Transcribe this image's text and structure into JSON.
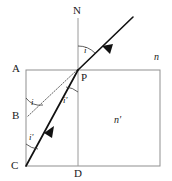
{
  "figure": {
    "background_color": "#ffffff",
    "line_color": "#1a1a1a",
    "box_color": "#808080",
    "normal_color": "#8c8c8c",
    "dotted_color": "#4d4d4d"
  },
  "labels": {
    "normal_top": "N",
    "point_A": "A",
    "point_B": "B",
    "point_C": "C",
    "point_D": "D",
    "point_P": "P",
    "index_outside": "n",
    "index_inside": "n′",
    "angle_incidence_at_P": "i",
    "angle_refraction_at_P": "i′",
    "angle_at_B": "i",
    "angle_at_C": "i′"
  },
  "geometry": {
    "rect": {
      "left": 26,
      "top": 70,
      "right": 160,
      "bottom": 166
    },
    "normal_line": {
      "x": 78,
      "y_top": 18,
      "y_bottom": 166
    },
    "point_P": {
      "x": 78,
      "y": 70
    },
    "point_B": {
      "x": 26,
      "y": 116
    },
    "point_C": {
      "x": 26,
      "y": 166
    },
    "incident_ray_start": {
      "x": 132,
      "y": 18
    },
    "refracted_ray_end": {
      "x": 26,
      "y": 166
    }
  }
}
